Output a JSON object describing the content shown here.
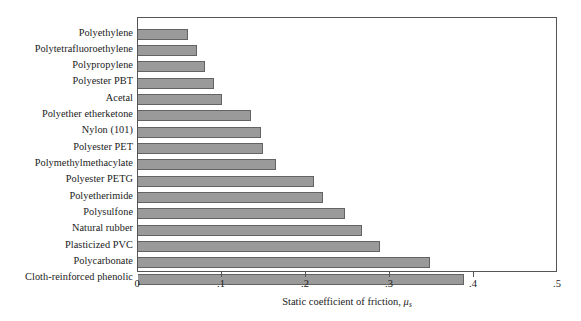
{
  "chart_data": {
    "type": "bar",
    "orientation": "horizontal",
    "title": "",
    "xlabel": "Static coefficient of friction, μₛ",
    "xlabel_parts": {
      "text": "Static coefficient of friction, ",
      "symbol": "μ",
      "subscript": "s"
    },
    "ylabel": "",
    "xlim": [
      0,
      0.5
    ],
    "xticks": [
      0,
      0.1,
      0.2,
      0.3,
      0.4,
      0.5
    ],
    "xtick_labels": [
      "0",
      ".1",
      ".2",
      ".3",
      ".4",
      ".5"
    ],
    "grid": false,
    "legend": null,
    "bar_color": "#9a9a9a",
    "bar_edge_color": "#636363",
    "axis_color": "#555555",
    "categories": [
      "Polyethylene",
      "Polytetrafluoroethylene",
      "Polypropylene",
      "Polyester PBT",
      "Acetal",
      "Polyether etherketone",
      "Nylon (101)",
      "Polyester PET",
      "Polymethylmethacylate",
      "Polyester PETG",
      "Polyetherimide",
      "Polysulfone",
      "Natural rubber",
      "Plasticized PVC",
      "Polycarbonate",
      "Cloth-reinforced phenolic"
    ],
    "values": [
      0.06,
      0.07,
      0.08,
      0.09,
      0.1,
      0.135,
      0.147,
      0.149,
      0.164,
      0.21,
      0.22,
      0.247,
      0.267,
      0.288,
      0.348,
      0.388
    ]
  }
}
